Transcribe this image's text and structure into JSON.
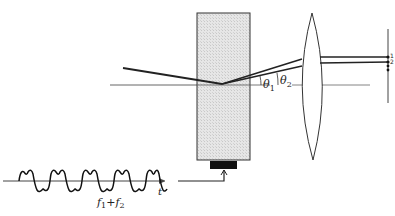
{
  "diagram": {
    "type": "acousto-optic deflector schematic",
    "labels": {
      "theta1": "θ",
      "theta1_sub": "1",
      "theta2": "θ",
      "theta2_sub": "2",
      "order1": "1",
      "order2": "2",
      "time_axis": "t",
      "signal_f1": "f",
      "signal_f1_sub": "1",
      "signal_plus": "+",
      "signal_f2": "f",
      "signal_f2_sub": "2"
    },
    "components": [
      {
        "id": "crystal",
        "description": "hatched acousto-optic crystal block"
      },
      {
        "id": "transducer",
        "description": "black piezo transducer at bottom of crystal"
      },
      {
        "id": "lens",
        "description": "biconvex focusing lens"
      },
      {
        "id": "screen",
        "description": "vertical output plane with focused spots"
      },
      {
        "id": "rf-signal",
        "description": "two-tone drive waveform f1+f2 versus time"
      }
    ],
    "colors": {
      "line": "#222222",
      "crystal_fill": "#e4e4e4",
      "transducer": "#111111"
    }
  }
}
